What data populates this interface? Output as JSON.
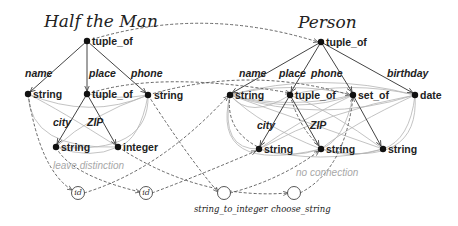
{
  "diagram": {
    "left_schema": {
      "title": "Half the Man",
      "nodes": [
        {
          "id": "L0",
          "label": "tuple_of",
          "x": 87,
          "y": 41
        },
        {
          "id": "L1",
          "label": "string",
          "x": 28,
          "y": 94
        },
        {
          "id": "L2",
          "label": "tuple_of",
          "x": 87,
          "y": 94
        },
        {
          "id": "L3",
          "label": "string",
          "x": 148,
          "y": 95
        },
        {
          "id": "L4",
          "label": "string",
          "x": 56,
          "y": 147
        },
        {
          "id": "L5",
          "label": "integer",
          "x": 118,
          "y": 147
        }
      ],
      "edges": [
        {
          "from": "L0",
          "to": "L1",
          "label": "name"
        },
        {
          "from": "L0",
          "to": "L2",
          "label": "place"
        },
        {
          "from": "L0",
          "to": "L3",
          "label": "phone"
        },
        {
          "from": "L2",
          "to": "L4",
          "label": "city"
        },
        {
          "from": "L2",
          "to": "L5",
          "label": "ZIP"
        }
      ],
      "annotation": "leave distinction"
    },
    "right_schema": {
      "title": "Person",
      "nodes": [
        {
          "id": "R0",
          "label": "tuple_of",
          "x": 321,
          "y": 42
        },
        {
          "id": "R1",
          "label": "string",
          "x": 230,
          "y": 95
        },
        {
          "id": "R2",
          "label": "tuple_of",
          "x": 290,
          "y": 95
        },
        {
          "id": "R3",
          "label": "set_of",
          "x": 353,
          "y": 95
        },
        {
          "id": "R4",
          "label": "date",
          "x": 415,
          "y": 95
        },
        {
          "id": "R5",
          "label": "string",
          "x": 259,
          "y": 149
        },
        {
          "id": "R6",
          "label": "string",
          "x": 321,
          "y": 149
        },
        {
          "id": "R7",
          "label": "string",
          "x": 383,
          "y": 149
        }
      ],
      "edges": [
        {
          "from": "R0",
          "to": "R1",
          "label": "name"
        },
        {
          "from": "R0",
          "to": "R2",
          "label": "place"
        },
        {
          "from": "R0",
          "to": "R3",
          "label": "phone"
        },
        {
          "from": "R0",
          "to": "R4",
          "label": "birthday"
        },
        {
          "from": "R2",
          "to": "R5",
          "label": "city"
        },
        {
          "from": "R2",
          "to": "R6",
          "label": "ZIP"
        },
        {
          "from": "R3",
          "to": "R7",
          "label": ""
        }
      ],
      "annotation": "no connection"
    },
    "functions": [
      {
        "id": "F0",
        "label": "",
        "inner": "id",
        "x": 78,
        "y": 193
      },
      {
        "id": "F1",
        "label": "",
        "inner": "id",
        "x": 146,
        "y": 193
      },
      {
        "id": "F2",
        "label": "string_to_integer",
        "inner": "",
        "x": 224,
        "y": 193
      },
      {
        "id": "F3",
        "label": "choose_string",
        "inner": "",
        "x": 294,
        "y": 193
      }
    ],
    "colors": {
      "solid_edge": "#444444",
      "dashed_edge": "#555555",
      "gray_curve": "#b4b4b4",
      "node": "#111111",
      "annotation": "#a8a8a8"
    }
  }
}
